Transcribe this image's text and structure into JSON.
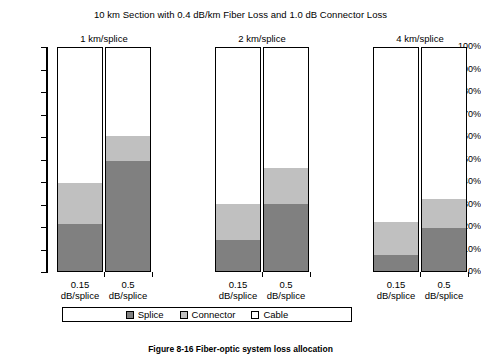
{
  "chart_data": {
    "type": "bar",
    "subtype": "stacked-column-100-percent",
    "title": "10 km Section with 0.4 dB/km Fiber Loss and 1.0 dB Connector Loss",
    "xlabel": "",
    "ylabel": "",
    "ylim": [
      0,
      100
    ],
    "ytick_labels": [
      "100%",
      "90%",
      "80%",
      "70%",
      "60%",
      "50%",
      "40%",
      "30%",
      "20%",
      "10%",
      "0%"
    ],
    "ytick_values": [
      100,
      90,
      80,
      70,
      60,
      50,
      40,
      30,
      20,
      10,
      0
    ],
    "grid": false,
    "legend_position": "bottom",
    "groups": [
      "1 km/splice",
      "2 km/splice",
      "4 km/splice"
    ],
    "categories": [
      "0.15 dB/splice",
      "0.5 dB/splice",
      "0.15 dB/splice",
      "0.5 dB/splice",
      "0.15 dB/splice",
      "0.5 dB/splice"
    ],
    "series": [
      {
        "name": "Splice",
        "color": "#808080",
        "values": [
          21,
          49,
          14,
          30,
          7,
          19
        ]
      },
      {
        "name": "Connector",
        "color": "#c0c0c0",
        "values": [
          18,
          11,
          16,
          16,
          15,
          13
        ]
      },
      {
        "name": "Cable",
        "color": "#ffffff",
        "values": [
          61,
          40,
          70,
          54,
          78,
          68
        ]
      }
    ]
  },
  "chart": {
    "title": "10 km Section with 0.4 dB/km Fiber Loss and 1.0 dB Connector Loss",
    "y_axis": {
      "ticks": [
        {
          "label": "100%",
          "value": 100
        },
        {
          "label": "90%",
          "value": 90
        },
        {
          "label": "80%",
          "value": 80
        },
        {
          "label": "70%",
          "value": 70
        },
        {
          "label": "60%",
          "value": 60
        },
        {
          "label": "50%",
          "value": 50
        },
        {
          "label": "40%",
          "value": 40
        },
        {
          "label": "30%",
          "value": 30
        },
        {
          "label": "20%",
          "value": 20
        },
        {
          "label": "10%",
          "value": 10
        },
        {
          "label": "0%",
          "value": 0
        }
      ]
    },
    "groups": [
      {
        "label": "1 km/splice",
        "bars": [
          {
            "line1": "0.15",
            "line2": "dB/splice",
            "splice": 21,
            "connector": 18,
            "cable": 61
          },
          {
            "line1": "0.5",
            "line2": "dB/splice",
            "splice": 49,
            "connector": 11,
            "cable": 40
          }
        ]
      },
      {
        "label": "2 km/splice",
        "bars": [
          {
            "line1": "0.15",
            "line2": "dB/splice",
            "splice": 14,
            "connector": 16,
            "cable": 70
          },
          {
            "line1": "0.5",
            "line2": "dB/splice",
            "splice": 30,
            "connector": 16,
            "cable": 54
          }
        ]
      },
      {
        "label": "4 km/splice",
        "bars": [
          {
            "line1": "0.15",
            "line2": "dB/splice",
            "splice": 7,
            "connector": 15,
            "cable": 78
          },
          {
            "line1": "0.5",
            "line2": "dB/splice",
            "splice": 19,
            "connector": 13,
            "cable": 68
          }
        ]
      }
    ],
    "legend": [
      {
        "label": "Splice",
        "color": "#808080"
      },
      {
        "label": "Connector",
        "color": "#c0c0c0"
      },
      {
        "label": "Cable",
        "color": "#ffffff"
      }
    ],
    "caption": "Figure 8-16   Fiber-optic system loss allocation"
  }
}
